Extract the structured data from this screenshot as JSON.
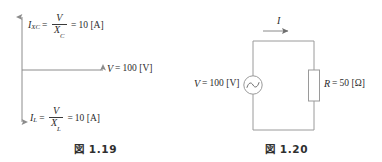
{
  "page": {
    "background_color": "#ffffff",
    "ink_color": "#2b2b2b",
    "line_color": "#8c8c8c"
  },
  "figures": [
    {
      "id": "phasor-diagram",
      "caption_prefix": "図",
      "caption_number": "1.19",
      "axes": {
        "vertical_label_top": "IXC axis (capacitive current, upward)",
        "horizontal_label": "V axis (reference voltage, rightward)",
        "vertical_label_bottom": "IL axis (inductive current, downward)"
      },
      "labels": {
        "capacitive_current": {
          "symbol": "I",
          "subscript": "XC",
          "equals": "=",
          "numerator": "V",
          "denominator": "X",
          "denominator_subscript": "C",
          "result_equals": "=",
          "value": "10",
          "unit": "[A]"
        },
        "voltage": {
          "symbol": "V",
          "equals": "=",
          "value": "100",
          "unit": "[V]"
        },
        "inductive_current": {
          "symbol": "I",
          "subscript": "L",
          "equals": "=",
          "numerator": "V",
          "denominator": "X",
          "denominator_subscript": "L",
          "result_equals": "=",
          "value": "10",
          "unit": "[A]"
        }
      }
    },
    {
      "id": "circuit-diagram",
      "caption_prefix": "図",
      "caption_number": "1.20",
      "labels": {
        "current": {
          "symbol": "I"
        },
        "source": {
          "symbol": "V",
          "equals": "=",
          "value": "100",
          "unit": "[V]",
          "component": "ac-voltage-source"
        },
        "resistor": {
          "symbol": "R",
          "equals": "=",
          "value": "50",
          "unit": "[Ω]",
          "component": "resistor"
        }
      }
    }
  ]
}
